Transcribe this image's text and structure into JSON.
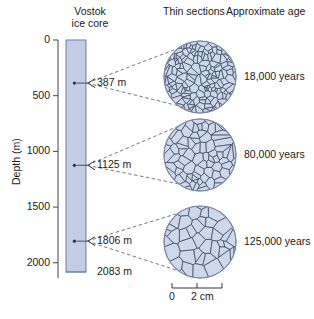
{
  "figure": {
    "background": "#ffffff",
    "core_fill": "#c3cce4",
    "core_stroke": "#6b7fa8",
    "crystal_fill": "#cdd8ec",
    "crystal_stroke": "#34415c",
    "line_color": "#555555"
  },
  "core_panel": {
    "title_line1": "Vostok",
    "title_line2": "ice core",
    "axis_label": "Depth (m)",
    "ticks": [
      {
        "value": 0,
        "label": "0"
      },
      {
        "value": 500,
        "label": "500"
      },
      {
        "value": 1000,
        "label": "1000"
      },
      {
        "value": 1500,
        "label": "1500"
      },
      {
        "value": 2000,
        "label": "2000"
      }
    ],
    "axis_min": 0,
    "axis_max": 2100,
    "core_top": 0,
    "core_bottom": 2083,
    "bottom_label": "2083 m",
    "markers": [
      {
        "depth": 387,
        "label": "387 m"
      },
      {
        "depth": 1125,
        "label": "1125 m"
      },
      {
        "depth": 1806,
        "label": "1806 m"
      }
    ]
  },
  "sections_panel": {
    "header_sections": "Thin sections",
    "header_age": "Approximate age",
    "sections": [
      {
        "depth_label": "387 m",
        "age_label": "18,000 years",
        "grain": "fine"
      },
      {
        "depth_label": "1125 m",
        "age_label": "80,000 years",
        "grain": "medium"
      },
      {
        "depth_label": "1806 m",
        "age_label": "125,000 years",
        "grain": "coarse"
      }
    ]
  },
  "scale_bar": {
    "start_label": "0",
    "end_label": "2 cm",
    "ticks": 3
  }
}
